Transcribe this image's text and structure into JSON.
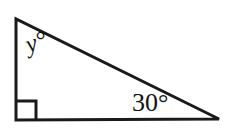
{
  "figure": {
    "type": "geometry-diagram",
    "shape": "right-triangle",
    "background_color": "#ffffff",
    "stroke_color": "#1a1a1a",
    "stroke_width": 3,
    "vertices": {
      "top_left": [
        16,
        19
      ],
      "bottom_left": [
        16,
        120
      ],
      "bottom_right": [
        219,
        119
      ]
    },
    "edges": [
      {
        "name": "left-leg",
        "from": "top_left",
        "to": "bottom_left"
      },
      {
        "name": "bottom-leg",
        "from": "bottom_left",
        "to": "bottom_right"
      },
      {
        "name": "hypotenuse",
        "from": "top_left",
        "to": "bottom_right"
      }
    ],
    "right_angle_marker": {
      "at": "bottom_left",
      "size": 19,
      "x": 17,
      "y": 101
    },
    "labels": [
      {
        "name": "angle-label-y",
        "text": "y°",
        "at_vertex": "top_left",
        "x": 22,
        "y": 33,
        "rotation_deg": -18,
        "style": "italic",
        "font_size": 25,
        "color": "#121212"
      },
      {
        "name": "angle-label-30",
        "text": "30°",
        "at_vertex": "bottom_right",
        "x": 132,
        "y": 90,
        "rotation_deg": 0,
        "style": "normal",
        "font_size": 26,
        "color": "#121212"
      }
    ]
  }
}
